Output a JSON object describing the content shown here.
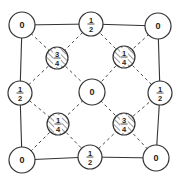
{
  "diagram": {
    "colors": {
      "line": "#333333",
      "fill": "#ffffff",
      "hatch": "#444444",
      "text": "#222222"
    },
    "atoms": [
      {
        "id": "corner-tl",
        "x": 22,
        "y": 25,
        "r": 13,
        "label": "0",
        "hatched": false
      },
      {
        "id": "corner-tr",
        "x": 158,
        "y": 26,
        "r": 13,
        "label": "0",
        "hatched": false
      },
      {
        "id": "corner-bl",
        "x": 22,
        "y": 160,
        "r": 13,
        "label": "0",
        "hatched": false
      },
      {
        "id": "corner-br",
        "x": 156,
        "y": 158,
        "r": 13,
        "label": "0",
        "hatched": false
      },
      {
        "id": "edge-top",
        "x": 91,
        "y": 24,
        "r": 12,
        "num": "1",
        "den": "2",
        "hatched": false
      },
      {
        "id": "edge-left",
        "x": 20,
        "y": 93,
        "r": 12,
        "num": "1",
        "den": "2",
        "hatched": false
      },
      {
        "id": "edge-right",
        "x": 160,
        "y": 93,
        "r": 12,
        "num": "1",
        "den": "2",
        "hatched": false
      },
      {
        "id": "edge-bottom",
        "x": 90,
        "y": 157,
        "r": 12,
        "num": "1",
        "den": "2",
        "hatched": false
      },
      {
        "id": "center",
        "x": 92,
        "y": 92,
        "r": 13,
        "label": "0",
        "hatched": false
      },
      {
        "id": "inner-tl",
        "x": 57,
        "y": 58,
        "r": 11,
        "num": "3",
        "den": "4",
        "hatched": true
      },
      {
        "id": "inner-tr",
        "x": 124,
        "y": 57,
        "r": 11,
        "num": "1",
        "den": "4",
        "hatched": true
      },
      {
        "id": "inner-bl",
        "x": 58,
        "y": 124,
        "r": 11,
        "num": "1",
        "den": "4",
        "hatched": true
      },
      {
        "id": "inner-br",
        "x": 124,
        "y": 124,
        "r": 11,
        "num": "3",
        "den": "4",
        "hatched": true
      }
    ],
    "solid_edges": [
      [
        "corner-tl",
        "edge-top"
      ],
      [
        "edge-top",
        "corner-tr"
      ],
      [
        "corner-tr",
        "edge-right"
      ],
      [
        "edge-right",
        "corner-br"
      ],
      [
        "corner-br",
        "edge-bottom"
      ],
      [
        "edge-bottom",
        "corner-bl"
      ],
      [
        "corner-bl",
        "edge-left"
      ],
      [
        "edge-left",
        "corner-tl"
      ]
    ],
    "dashed_edges": [
      [
        "edge-top",
        "inner-tl"
      ],
      [
        "inner-tl",
        "edge-left"
      ],
      [
        "edge-left",
        "inner-bl"
      ],
      [
        "inner-bl",
        "edge-bottom"
      ],
      [
        "edge-bottom",
        "inner-br"
      ],
      [
        "inner-br",
        "edge-right"
      ],
      [
        "edge-right",
        "inner-tr"
      ],
      [
        "inner-tr",
        "edge-top"
      ],
      [
        "inner-tl",
        "center"
      ],
      [
        "center",
        "inner-br"
      ],
      [
        "inner-tr",
        "center"
      ],
      [
        "center",
        "inner-bl"
      ],
      [
        "corner-tl",
        "inner-tl"
      ],
      [
        "corner-tr",
        "inner-tr"
      ],
      [
        "corner-bl",
        "inner-bl"
      ],
      [
        "corner-br",
        "inner-br"
      ]
    ]
  }
}
